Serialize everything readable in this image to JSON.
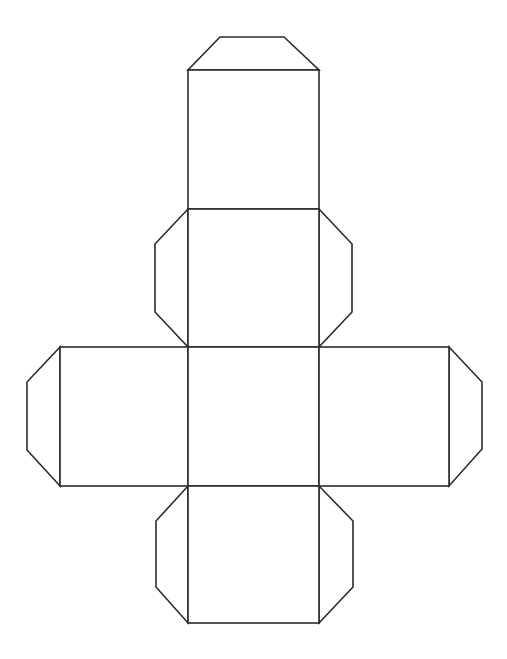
{
  "diagram": {
    "type": "cube-net",
    "background": "#ffffff",
    "stroke": "#2b2b2b",
    "faces": [
      {
        "id": "face-top",
        "x": 188,
        "y": 70,
        "w": 131,
        "h": 139
      },
      {
        "id": "face-upper-middle",
        "x": 188,
        "y": 209,
        "w": 131,
        "h": 138
      },
      {
        "id": "face-left",
        "x": 60,
        "y": 347,
        "w": 128,
        "h": 139
      },
      {
        "id": "face-center",
        "x": 188,
        "y": 347,
        "w": 131,
        "h": 139
      },
      {
        "id": "face-right",
        "x": 319,
        "y": 347,
        "w": 130,
        "h": 139
      },
      {
        "id": "face-bottom",
        "x": 188,
        "y": 486,
        "w": 131,
        "h": 137
      }
    ],
    "tabs": [
      {
        "id": "tab-top",
        "points": "188,70 220,37 284,37 319,70"
      },
      {
        "id": "tab-upper-left",
        "points": "188,209 155,244 155,312 188,347"
      },
      {
        "id": "tab-upper-right",
        "points": "319,209 352,244 352,312 319,347"
      },
      {
        "id": "tab-far-left",
        "points": "60,347 27,382 27,450 60,486"
      },
      {
        "id": "tab-far-right",
        "points": "449,347 482,382 482,449 449,486"
      },
      {
        "id": "tab-lower-left",
        "points": "188,486 156,521 156,587 188,623"
      },
      {
        "id": "tab-lower-right",
        "points": "319,486 353,521 353,587 319,623"
      }
    ]
  }
}
